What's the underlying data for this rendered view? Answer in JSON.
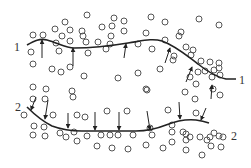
{
  "figure": {
    "width": 251,
    "height": 168,
    "background": "#ffffff",
    "stroke_color": "#222222",
    "particle_color": "#555555"
  },
  "labels": {
    "curve1_left": "1",
    "curve1_right": "1",
    "curve2_left": "2",
    "curve2_right": "2"
  },
  "curves": [
    {
      "id": "interface-1",
      "path": "M27,45 C34,41 40,38 47,40 C58,43 66,48 74,48 C90,48 110,46 128,43 C142,41 152,38 162,41 C176,46 186,55 198,64 C208,72 216,77 226,79 L236,79"
    },
    {
      "id": "interface-2",
      "path": "M27,107 C34,114 42,121 52,126 C60,129 70,131 82,131 L136,131 C146,131 156,129 166,125 C176,121 186,119 196,120 C203,121 206,122 209,123"
    }
  ],
  "arrows_up": [
    {
      "x1": 42,
      "y1": 58,
      "x2": 42,
      "y2": 40
    },
    {
      "x1": 73,
      "y1": 66,
      "x2": 73,
      "y2": 48
    },
    {
      "x1": 124,
      "y1": 58,
      "x2": 126,
      "y2": 44
    },
    {
      "x1": 165,
      "y1": 63,
      "x2": 170,
      "y2": 48
    },
    {
      "x1": 186,
      "y1": 82,
      "x2": 192,
      "y2": 67
    },
    {
      "x1": 211,
      "y1": 99,
      "x2": 212,
      "y2": 85
    }
  ],
  "arrows_down": [
    {
      "x1": 36,
      "y1": 97,
      "x2": 31,
      "y2": 110
    },
    {
      "x1": 48,
      "y1": 100,
      "x2": 45,
      "y2": 119
    },
    {
      "x1": 68,
      "y1": 113,
      "x2": 68,
      "y2": 128
    },
    {
      "x1": 95,
      "y1": 112,
      "x2": 95,
      "y2": 130
    },
    {
      "x1": 119,
      "y1": 112,
      "x2": 119,
      "y2": 130
    },
    {
      "x1": 147,
      "y1": 111,
      "x2": 150,
      "y2": 130
    },
    {
      "x1": 179,
      "y1": 102,
      "x2": 180,
      "y2": 119
    },
    {
      "x1": 206,
      "y1": 108,
      "x2": 201,
      "y2": 120
    }
  ],
  "particles": [
    [
      87,
      15
    ],
    [
      114,
      18
    ],
    [
      124,
      21
    ],
    [
      151,
      17
    ],
    [
      165,
      22
    ],
    [
      199,
      19
    ],
    [
      219,
      25
    ],
    [
      65,
      22
    ],
    [
      55,
      29
    ],
    [
      70,
      30
    ],
    [
      82,
      31
    ],
    [
      102,
      27
    ],
    [
      112,
      26
    ],
    [
      124,
      31
    ],
    [
      146,
      33
    ],
    [
      181,
      32
    ],
    [
      33,
      35
    ],
    [
      43,
      35
    ],
    [
      62,
      36
    ],
    [
      83,
      36
    ],
    [
      111,
      36
    ],
    [
      56,
      43
    ],
    [
      70,
      41
    ],
    [
      86,
      42
    ],
    [
      98,
      42
    ],
    [
      110,
      44
    ],
    [
      31,
      52
    ],
    [
      59,
      51
    ],
    [
      88,
      53
    ],
    [
      106,
      49
    ],
    [
      138,
      44
    ],
    [
      152,
      49
    ],
    [
      165,
      40
    ],
    [
      179,
      36
    ],
    [
      186,
      47
    ],
    [
      193,
      50
    ],
    [
      191,
      55
    ],
    [
      201,
      61
    ],
    [
      210,
      62
    ],
    [
      219,
      63
    ],
    [
      205,
      71
    ],
    [
      214,
      70
    ],
    [
      219,
      68
    ],
    [
      220,
      75
    ],
    [
      198,
      72
    ],
    [
      174,
      56
    ],
    [
      213,
      89
    ],
    [
      195,
      99
    ],
    [
      220,
      95
    ],
    [
      33,
      64
    ],
    [
      52,
      69
    ],
    [
      61,
      72
    ],
    [
      70,
      67
    ],
    [
      84,
      76
    ],
    [
      118,
      78
    ],
    [
      138,
      73
    ],
    [
      160,
      69
    ],
    [
      173,
      60
    ],
    [
      190,
      77
    ],
    [
      212,
      77
    ],
    [
      196,
      84
    ],
    [
      33,
      87
    ],
    [
      46,
      89
    ],
    [
      72,
      91
    ],
    [
      146,
      89
    ],
    [
      33,
      99
    ],
    [
      45,
      99
    ],
    [
      73,
      97
    ],
    [
      147,
      90
    ],
    [
      185,
      92
    ],
    [
      24,
      115
    ],
    [
      53,
      115
    ],
    [
      77,
      115
    ],
    [
      85,
      117
    ],
    [
      107,
      111
    ],
    [
      127,
      111
    ],
    [
      168,
      110
    ],
    [
      196,
      113
    ],
    [
      34,
      126
    ],
    [
      44,
      127
    ],
    [
      33,
      135
    ],
    [
      45,
      136
    ],
    [
      60,
      133
    ],
    [
      66,
      137
    ],
    [
      74,
      132
    ],
    [
      77,
      141
    ],
    [
      87,
      136
    ],
    [
      101,
      135
    ],
    [
      110,
      135
    ],
    [
      118,
      135
    ],
    [
      133,
      135
    ],
    [
      152,
      135
    ],
    [
      172,
      132
    ],
    [
      183,
      132
    ],
    [
      190,
      137
    ],
    [
      186,
      134
    ],
    [
      200,
      137
    ],
    [
      207,
      140
    ],
    [
      210,
      137
    ],
    [
      214,
      133
    ],
    [
      219,
      136
    ],
    [
      223,
      137
    ],
    [
      97,
      146
    ],
    [
      112,
      148
    ],
    [
      128,
      149
    ],
    [
      146,
      145
    ],
    [
      163,
      148
    ],
    [
      172,
      142
    ],
    [
      186,
      140
    ],
    [
      186,
      150
    ],
    [
      202,
      155
    ],
    [
      211,
      146
    ],
    [
      221,
      147
    ],
    [
      172,
      125
    ],
    [
      150,
      128
    ]
  ]
}
